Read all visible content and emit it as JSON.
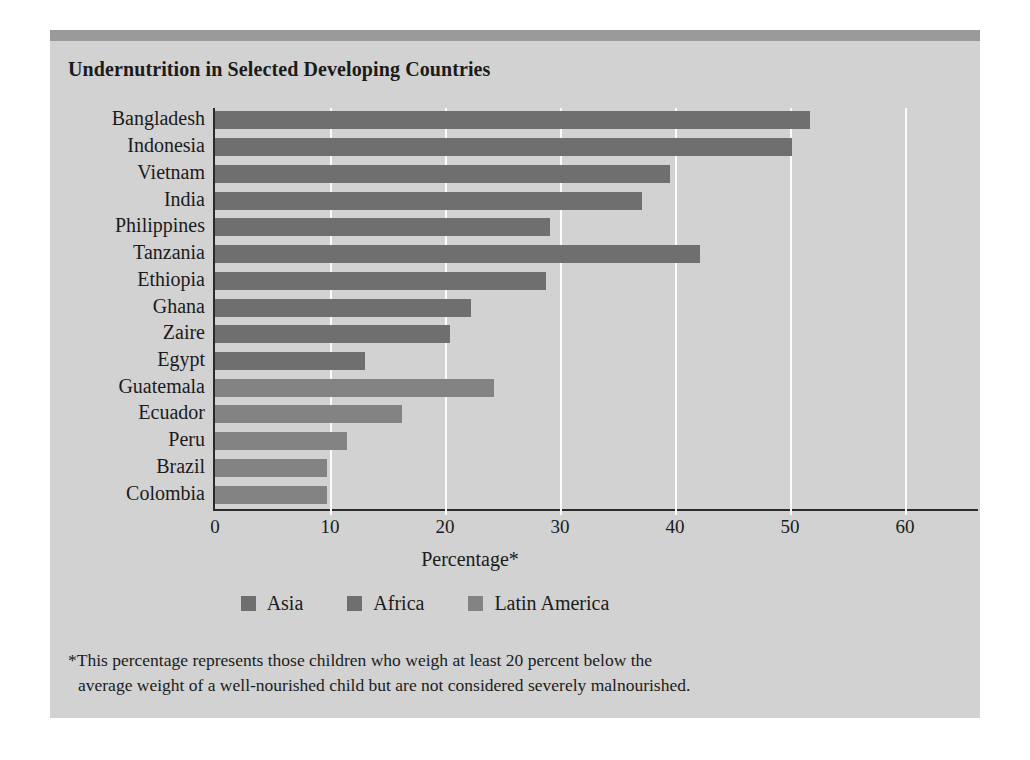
{
  "chart_data": {
    "type": "bar",
    "orientation": "horizontal",
    "title": "Undernutrition in Selected Developing Countries",
    "xlabel": "Percentage*",
    "ylabel": "",
    "xlim": [
      0,
      60
    ],
    "xticks": [
      0,
      10,
      20,
      30,
      40,
      50,
      60
    ],
    "xtick_labels": [
      "0",
      "10",
      "20",
      "30",
      "40",
      "50",
      "60"
    ],
    "grid": true,
    "grid_axis": "x",
    "legend_position": "bottom",
    "categories": [
      "Bangladesh",
      "Indonesia",
      "Vietnam",
      "India",
      "Philippines",
      "Tanzania",
      "Ethiopia",
      "Ghana",
      "Zaire",
      "Egypt",
      "Guatemala",
      "Ecuador",
      "Peru",
      "Brazil",
      "Colombia"
    ],
    "values": [
      51.7,
      50.2,
      39.6,
      37.1,
      29.1,
      42.2,
      28.8,
      22.3,
      20.4,
      13.0,
      24.3,
      16.3,
      11.5,
      9.7,
      9.7
    ],
    "groups": [
      "Asia",
      "Asia",
      "Asia",
      "Asia",
      "Asia",
      "Africa",
      "Africa",
      "Africa",
      "Africa",
      "Africa",
      "Latin America",
      "Latin America",
      "Latin America",
      "Latin America",
      "Latin America"
    ],
    "legend": [
      {
        "label": "Asia",
        "color": "#6f6f6f"
      },
      {
        "label": "Africa",
        "color": "#6f6f6f"
      },
      {
        "label": "Latin America",
        "color": "#838383"
      }
    ],
    "annotations": {
      "footnote_line1": "*This percentage represents those children who weigh at least 20 percent below the",
      "footnote_line2": "average weight of a well-nourished child but are not considered severely malnourished."
    }
  },
  "colors": {
    "panel_background": "#d2d2d2",
    "top_bar": "#9a9a9a",
    "axis": "#2b2b2b",
    "gridline": "#fbfbfb",
    "bar_asia": "#6f6f6f",
    "bar_africa": "#6f6f6f",
    "bar_latin": "#838383",
    "text": "#1b1b1b",
    "page_background": "#ffffff"
  }
}
